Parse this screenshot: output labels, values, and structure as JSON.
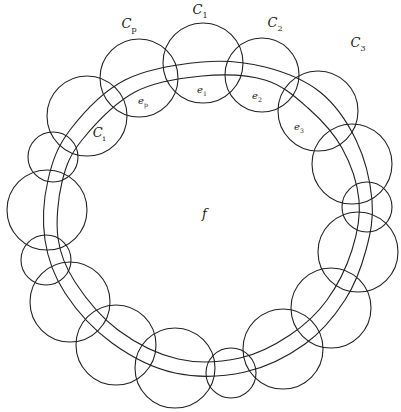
{
  "diagram": {
    "stroke_color": "#222222",
    "background": "#ffffff",
    "face_label": "f",
    "circle_labels": [
      {
        "id": "C1",
        "main": "C",
        "sub": "1",
        "x": 200,
        "y": 14
      },
      {
        "id": "C2",
        "main": "C",
        "sub": "2",
        "x": 275,
        "y": 27
      },
      {
        "id": "C3",
        "main": "C",
        "sub": "3",
        "x": 358,
        "y": 47
      },
      {
        "id": "Cp",
        "main": "C",
        "sub": "p",
        "x": 129,
        "y": 28
      },
      {
        "id": "Ci",
        "main": "C",
        "sub": "i",
        "x": 99,
        "y": 137
      }
    ],
    "edge_labels": [
      {
        "id": "e1",
        "main": "e",
        "sub": "1",
        "x": 202,
        "y": 93
      },
      {
        "id": "e2",
        "main": "e",
        "sub": "2",
        "x": 257,
        "y": 99
      },
      {
        "id": "e3",
        "main": "e",
        "sub": "3",
        "x": 299,
        "y": 130
      },
      {
        "id": "ep",
        "main": "e",
        "sub": "p",
        "x": 143,
        "y": 104
      }
    ],
    "circles": [
      {
        "cx": 203,
        "cy": 63,
        "r": 40
      },
      {
        "cx": 262,
        "cy": 75,
        "r": 37
      },
      {
        "cx": 318,
        "cy": 111,
        "r": 40
      },
      {
        "cx": 352,
        "cy": 164,
        "r": 40
      },
      {
        "cx": 367,
        "cy": 207,
        "r": 25
      },
      {
        "cx": 358,
        "cy": 252,
        "r": 40
      },
      {
        "cx": 331,
        "cy": 308,
        "r": 40
      },
      {
        "cx": 283,
        "cy": 349,
        "r": 40
      },
      {
        "cx": 231,
        "cy": 373,
        "r": 25
      },
      {
        "cx": 175,
        "cy": 368,
        "r": 40
      },
      {
        "cx": 116,
        "cy": 345,
        "r": 40
      },
      {
        "cx": 70,
        "cy": 302,
        "r": 40
      },
      {
        "cx": 46,
        "cy": 260,
        "r": 25
      },
      {
        "cx": 47,
        "cy": 210,
        "r": 40
      },
      {
        "cx": 53,
        "cy": 157,
        "r": 25
      },
      {
        "cx": 87,
        "cy": 116,
        "r": 40
      },
      {
        "cx": 139,
        "cy": 78,
        "r": 39
      }
    ],
    "outer_band": [
      [
        202,
        62
      ],
      [
        265,
        67
      ],
      [
        320,
        92
      ],
      [
        356,
        140
      ],
      [
        372,
        200
      ],
      [
        366,
        250
      ],
      [
        345,
        300
      ],
      [
        305,
        344
      ],
      [
        245,
        372
      ],
      [
        175,
        373
      ],
      [
        112,
        343
      ],
      [
        65,
        293
      ],
      [
        45,
        240
      ],
      [
        48,
        180
      ],
      [
        70,
        130
      ],
      [
        125,
        80
      ]
    ],
    "inner_band": [
      [
        202,
        76
      ],
      [
        265,
        80
      ],
      [
        308,
        108
      ],
      [
        342,
        148
      ],
      [
        359,
        200
      ],
      [
        352,
        250
      ],
      [
        327,
        300
      ],
      [
        290,
        335
      ],
      [
        240,
        358
      ],
      [
        178,
        359
      ],
      [
        118,
        330
      ],
      [
        75,
        282
      ],
      [
        58,
        238
      ],
      [
        62,
        182
      ],
      [
        82,
        140
      ],
      [
        135,
        92
      ]
    ]
  }
}
